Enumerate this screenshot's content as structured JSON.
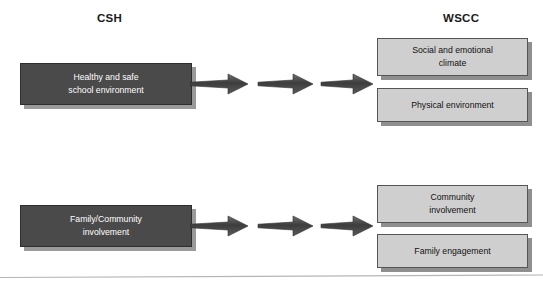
{
  "diagram": {
    "type": "flow-mapping",
    "columns": [
      {
        "id": "csh",
        "title": "CSH"
      },
      {
        "id": "wscc",
        "title": "WSCC"
      }
    ],
    "colors": {
      "source_box_fill": "#4a4a4a",
      "source_box_text": "#ffffff",
      "target_box_fill": "#cfcfcf",
      "target_box_text": "#111111",
      "arrow_fill": "#4a4a4a",
      "shadow": "#9a9a9a",
      "background": "#ffffff"
    },
    "rows": [
      {
        "source": {
          "label": "Healthy and safe\nschool environment"
        },
        "arrows": {
          "count": 3,
          "direction": "right",
          "icon": "arrow-right-icon"
        },
        "targets": [
          {
            "label": "Social and emotional\nclimate"
          },
          {
            "label": "Physical environment"
          }
        ]
      },
      {
        "source": {
          "label": "Family/Community\ninvolvement"
        },
        "arrows": {
          "count": 3,
          "direction": "right",
          "icon": "arrow-right-icon"
        },
        "targets": [
          {
            "label": "Community\ninvolvement"
          },
          {
            "label": "Family engagement"
          }
        ]
      }
    ],
    "footer_rule": {
      "visible": true,
      "color": "#b5b5b5"
    }
  }
}
